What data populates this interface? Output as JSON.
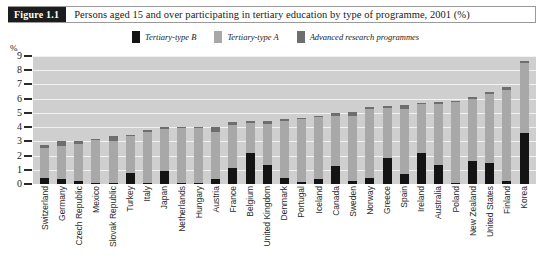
{
  "figure": {
    "number_label": "Figure 1.1",
    "caption": "Persons aged 15 and over participating in tertiary education by type of programme, 2001 (%)"
  },
  "colors": {
    "tertiary_type_b": "#141414",
    "tertiary_type_a": "#a8a8a8",
    "advanced_research": "#6e6e6e",
    "plot_background": "#cfcfcf",
    "gridline": "#f2f2f2",
    "header_block": "#1c1c1c"
  },
  "axes": {
    "y_unit": "%",
    "y_ticks": [
      "0",
      "1",
      "2",
      "3",
      "4",
      "5",
      "6",
      "7",
      "8",
      "9"
    ]
  },
  "chart_data": {
    "type": "bar",
    "title": "Persons aged 15 and over participating in tertiary education by type of programme, 2001 (%)",
    "xlabel": "",
    "ylabel": "%",
    "ylim": [
      0,
      9
    ],
    "grid": true,
    "stacked": true,
    "legend_position": "top-center",
    "categories": [
      "Switzerland",
      "Germany",
      "Czech Republic",
      "Mexico",
      "Slovak Republic",
      "Turkey",
      "Italy",
      "Japan",
      "Netherlands",
      "Hungary",
      "Austria",
      "France",
      "Belgium",
      "United Kingdom",
      "Denmark",
      "Portugal",
      "Iceland",
      "Canada",
      "Sweden",
      "Norway",
      "Greece",
      "Spain",
      "Ireland",
      "Australia",
      "Poland",
      "New Zealand",
      "United States",
      "Finland",
      "Korea"
    ],
    "series": [
      {
        "name": "Tertiary-type B",
        "color": "#141414",
        "values": [
          0.45,
          0.35,
          0.2,
          0.05,
          0.1,
          0.8,
          0.05,
          0.95,
          0.1,
          0.05,
          0.35,
          1.1,
          2.2,
          1.35,
          0.4,
          0.15,
          0.35,
          1.3,
          0.2,
          0.4,
          1.85,
          0.7,
          2.2,
          1.35,
          0.05,
          1.6,
          1.5,
          0.2,
          3.6
        ]
      },
      {
        "name": "Tertiary-type A",
        "color": "#a8a8a8",
        "values": [
          2.05,
          2.35,
          2.6,
          3.05,
          2.95,
          2.55,
          3.6,
          2.95,
          3.85,
          3.9,
          3.3,
          3.05,
          2.1,
          2.85,
          4.0,
          4.4,
          4.35,
          3.5,
          4.6,
          4.85,
          3.5,
          4.6,
          3.4,
          4.25,
          5.75,
          4.4,
          4.8,
          6.4,
          4.9
        ]
      },
      {
        "name": "Advanced research programmes",
        "color": "#6e6e6e",
        "values": [
          0.25,
          0.3,
          0.25,
          0.05,
          0.3,
          0.1,
          0.15,
          0.1,
          0.05,
          0.05,
          0.35,
          0.2,
          0.1,
          0.2,
          0.15,
          0.1,
          0.1,
          0.2,
          0.25,
          0.15,
          0.15,
          0.25,
          0.1,
          0.2,
          0.05,
          0.15,
          0.15,
          0.2,
          0.15
        ]
      }
    ],
    "totals": [
      2.75,
      3.0,
      3.05,
      3.15,
      3.35,
      3.45,
      3.8,
      4.0,
      4.0,
      4.0,
      4.0,
      4.35,
      4.4,
      4.4,
      4.55,
      4.65,
      4.8,
      5.0,
      5.05,
      5.4,
      5.5,
      5.55,
      5.7,
      5.8,
      5.85,
      6.15,
      6.45,
      6.8,
      8.65
    ]
  }
}
